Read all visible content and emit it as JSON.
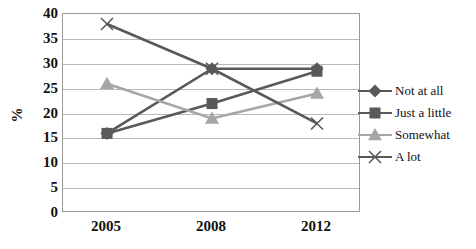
{
  "chart_data": {
    "type": "line",
    "title": "",
    "xlabel": "",
    "ylabel": "%",
    "categories": [
      "2005",
      "2008",
      "2012"
    ],
    "ylim": [
      0,
      40
    ],
    "ytick_step": 5,
    "yticks": [
      "40",
      "35",
      "30",
      "25",
      "20",
      "15",
      "10",
      "5",
      "0"
    ],
    "grid": true,
    "legend_position": "right",
    "series": [
      {
        "name": "Not at all",
        "values": [
          16,
          29,
          29
        ],
        "marker": "diamond",
        "color": "#595959"
      },
      {
        "name": "Just a little",
        "values": [
          16,
          22,
          28.5
        ],
        "marker": "square",
        "color": "#595959"
      },
      {
        "name": "Somewhat",
        "values": [
          26,
          19,
          24
        ],
        "marker": "triangle",
        "color": "#a6a6a6"
      },
      {
        "name": "A lot",
        "values": [
          38,
          29,
          18
        ],
        "marker": "cross",
        "color": "#595959"
      }
    ]
  },
  "legend": {
    "items": [
      {
        "label": "Not at all",
        "marker_name": "diamond-marker-icon"
      },
      {
        "label": "Just a little",
        "marker_name": "square-marker-icon"
      },
      {
        "label": "Somewhat",
        "marker_name": "triangle-marker-icon"
      },
      {
        "label": "A lot",
        "marker_name": "cross-marker-icon"
      }
    ]
  },
  "axes": {
    "y_title": "%",
    "y_labels": [
      "40",
      "35",
      "30",
      "25",
      "20",
      "15",
      "10",
      "5",
      "0"
    ],
    "x_labels": [
      "2005",
      "2008",
      "2012"
    ]
  },
  "colors": {
    "dark_series": "#595959",
    "light_series": "#a6a6a6",
    "gridline": "#b9b9b9",
    "axis_border": "#9a9a9a",
    "text": "#111111",
    "background": "#ffffff"
  }
}
